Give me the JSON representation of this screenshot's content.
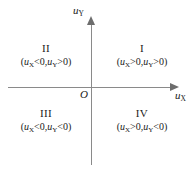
{
  "figure": {
    "background_color": "#ffffff",
    "axis_color": "#8a8a8a",
    "text_color": "#1a1a1a"
  },
  "axes": {
    "x": {
      "label_var": "u",
      "label_sub": "X",
      "arrow_direction": "right"
    },
    "y": {
      "label_var": "u",
      "label_sub": "Y",
      "arrow_direction": "up"
    },
    "origin_label": "O"
  },
  "quadrants": [
    {
      "id": "I",
      "numeral": "I",
      "open_paren": "(",
      "close_paren": ")",
      "var1": "u",
      "sub1": "X",
      "op1": ">0,",
      "var2": "u",
      "sub2": "Y",
      "op2": ">0",
      "condition_text": "(uX>0,uY>0)"
    },
    {
      "id": "II",
      "numeral": "II",
      "open_paren": "(",
      "close_paren": ")",
      "var1": "u",
      "sub1": "X",
      "op1": "<0,",
      "var2": "u",
      "sub2": "Y",
      "op2": ">0",
      "condition_text": "(uX<0,uY>0)"
    },
    {
      "id": "III",
      "numeral": "III",
      "open_paren": "(",
      "close_paren": ")",
      "var1": "u",
      "sub1": "X",
      "op1": "<0,",
      "var2": "u",
      "sub2": "Y",
      "op2": "<0",
      "condition_text": "(uX<0,uY<0)"
    },
    {
      "id": "IV",
      "numeral": "IV",
      "open_paren": "(",
      "close_paren": ")",
      "var1": "u",
      "sub1": "X",
      "op1": ">0,",
      "var2": "u",
      "sub2": "Y",
      "op2": "<0",
      "condition_text": "(uX>0,uY<0)"
    }
  ],
  "chart_data": {
    "type": "scatter",
    "title": "",
    "xlabel": "uX",
    "ylabel": "uY",
    "xlim": [
      -1,
      1
    ],
    "ylim": [
      -1,
      1
    ],
    "grid": false,
    "legend": null,
    "annotations": [
      {
        "text": "I",
        "x": 0.5,
        "y": 0.5,
        "note": "(uX>0,uY>0)"
      },
      {
        "text": "II",
        "x": -0.5,
        "y": 0.5,
        "note": "(uX<0,uY>0)"
      },
      {
        "text": "III",
        "x": -0.5,
        "y": -0.5,
        "note": "(uX<0,uY<0)"
      },
      {
        "text": "IV",
        "x": 0.5,
        "y": -0.5,
        "note": "(uX>0,uY<0)"
      },
      {
        "text": "O",
        "x": 0,
        "y": 0,
        "note": "origin"
      }
    ]
  }
}
